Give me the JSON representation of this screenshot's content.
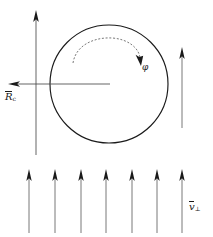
{
  "figure": {
    "background_color": "#ffffff",
    "line_color": "#1a1a1a",
    "faint_line_color": "#555555",
    "width": 213,
    "height": 237
  },
  "labels": {
    "radius_vector": {
      "symbol": "R",
      "subscript": "c",
      "text": "R"
    },
    "velocity_perp": {
      "symbol": "v",
      "subscript": "⊥",
      "text": "v"
    },
    "gyro_angle": {
      "symbol": "φ",
      "text": "φ"
    }
  },
  "geometry": {
    "circle": {
      "cx": 109,
      "cy": 84,
      "r": 59
    },
    "vertical_axis": {
      "x": 36,
      "y_top": 11,
      "y_bottom": 155
    },
    "radius_arrow": {
      "x_tail": 110,
      "x_tip": 10,
      "y": 84
    },
    "right_arrow": {
      "x": 182,
      "y_tip": 48,
      "y_tail": 128
    },
    "dashed_arc": {
      "start_x": 73,
      "start_y": 63,
      "top_y": 41,
      "end_x": 140,
      "end_y": 62
    }
  },
  "field_arrows": {
    "count": 7,
    "x_positions": [
      29,
      55,
      81,
      106,
      132,
      157,
      182
    ],
    "y_tip": 170,
    "y_tail": 233,
    "direction": "up"
  },
  "icons": {
    "arrow_up": "arrow-up-icon",
    "arrow_left": "arrow-left-icon",
    "arc_arrow": "curved-arrow-icon"
  }
}
